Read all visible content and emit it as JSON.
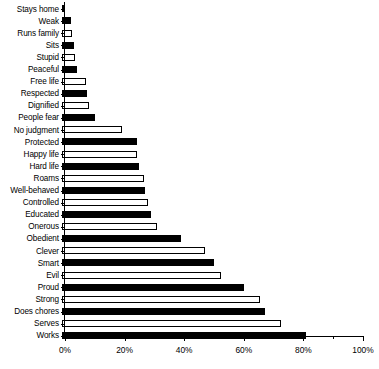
{
  "chart_data": {
    "type": "bar",
    "orientation": "horizontal",
    "title": "",
    "subtitle": "",
    "xlabel": "",
    "ylabel": "",
    "xlim": [
      0,
      100
    ],
    "xtick_labels": [
      "0%",
      "20%",
      "40%",
      "60%",
      "80%",
      "100%"
    ],
    "xtick_values": [
      0,
      20,
      40,
      60,
      80,
      100
    ],
    "xminor_tick_values": [
      10,
      30,
      50,
      70,
      90
    ],
    "grid": false,
    "legend": null,
    "categories": [
      "Stays home",
      "Weak",
      "Runs family",
      "Sits",
      "Stupid",
      "Peaceful",
      "Free life",
      "Respected",
      "Dignified",
      "People fear",
      "No judgment",
      "Protected",
      "Happy life",
      "Hard life",
      "Roams",
      "Well-behaved",
      "Controlled",
      "Educated",
      "Onerous",
      "Obedient",
      "Clever",
      "Smart",
      "Evil",
      "Proud",
      "Strong",
      "Does chores",
      "Serves",
      "Works"
    ],
    "values": [
      1,
      3,
      3.5,
      4,
      4.5,
      5,
      8,
      8.5,
      9,
      11,
      20,
      25,
      25,
      26,
      27.5,
      28,
      29,
      30,
      32,
      40,
      48,
      51,
      53.5,
      61,
      66.5,
      68,
      73.5,
      82
    ],
    "bar_styles": [
      "filled",
      "filled",
      "open",
      "filled",
      "open",
      "filled",
      "open",
      "filled",
      "open",
      "filled",
      "open",
      "filled",
      "open",
      "filled",
      "open",
      "filled",
      "open",
      "filled",
      "open",
      "filled",
      "open",
      "filled",
      "open",
      "filled",
      "open",
      "filled",
      "open",
      "filled"
    ],
    "colors": {
      "filled": "#000000",
      "open": "#ffffff",
      "outline": "#000000",
      "axis": "#000000",
      "background": "#ffffff"
    }
  }
}
